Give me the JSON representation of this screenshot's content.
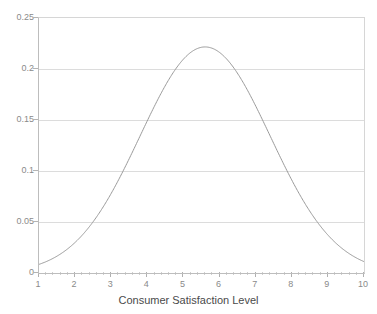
{
  "chart_data": {
    "type": "line",
    "title": "Normal Distribution",
    "xlabel": "Consumer Satisfaction Level",
    "ylabel": "",
    "xlim": [
      1,
      10
    ],
    "ylim": [
      0,
      0.25
    ],
    "grid": true,
    "legend": null,
    "curve_color": "#9a9a9a",
    "grid_color": "#dcdcdc",
    "tick_label_color": "#8a8a8a",
    "distribution": {
      "mean": 5.6,
      "std_dev": 1.8,
      "peak_value": 0.222
    },
    "x_tick_labels": [
      "1",
      "2",
      "3",
      "4",
      "5",
      "6",
      "7",
      "8",
      "9",
      "10"
    ],
    "x_tick_values": [
      1,
      2,
      3,
      4,
      5,
      6,
      7,
      8,
      9,
      10
    ],
    "y_tick_labels": [
      "0",
      "0.05",
      "0.1",
      "0.15",
      "0.2",
      "0.25"
    ],
    "y_tick_values": [
      0,
      0.05,
      0.1,
      0.15,
      0.2,
      0.25
    ],
    "x": [
      1,
      1.25,
      1.5,
      1.75,
      2,
      2.25,
      2.5,
      2.75,
      3,
      3.25,
      3.5,
      3.75,
      4,
      4.25,
      4.5,
      4.75,
      5,
      5.25,
      5.5,
      5.6,
      5.75,
      6,
      6.25,
      6.5,
      6.75,
      7,
      7.25,
      7.5,
      7.75,
      8,
      8.25,
      8.5,
      8.75,
      9,
      9.25,
      9.5,
      9.75,
      10
    ],
    "values": [
      0.0122,
      0.0157,
      0.0199,
      0.0249,
      0.0308,
      0.0376,
      0.0453,
      0.0539,
      0.0632,
      0.0731,
      0.0834,
      0.0938,
      0.1041,
      0.1139,
      0.1231,
      0.1513,
      0.1713,
      0.1879,
      0.2005,
      0.2216,
      0.2194,
      0.2142,
      0.2054,
      0.1934,
      0.1787,
      0.1619,
      0.1438,
      0.1252,
      0.1068,
      0.0891,
      0.0728,
      0.0582,
      0.0455,
      0.0348,
      0.026,
      0.019,
      0.0136,
      0.0122
    ]
  }
}
